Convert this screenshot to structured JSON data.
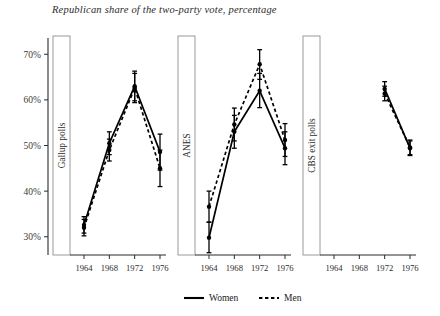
{
  "chart_data": {
    "type": "line",
    "title": "Republican share of the two-party vote, percentage",
    "xlabel": "",
    "ylabel": "",
    "ylim": [
      26,
      74
    ],
    "yticks": [
      30,
      40,
      50,
      60,
      70
    ],
    "ytick_labels": [
      "30%",
      "40%",
      "50%",
      "60%",
      "70%"
    ],
    "x": [
      1964,
      1968,
      1972,
      1976
    ],
    "xtick_labels": [
      "1964",
      "1968",
      "1972",
      "1976"
    ],
    "grid": false,
    "legend_position": "bottom",
    "legend": [
      {
        "label": "Women",
        "style": "solid"
      },
      {
        "label": "Men",
        "style": "dashed"
      }
    ],
    "panels": [
      {
        "label": "Gallup polls",
        "series": [
          {
            "name": "Women",
            "style": "solid",
            "values": [
              32.6,
              50.5,
              63.0,
              48.6
            ],
            "err_low": [
              30.8,
              48.0,
              59.8,
              44.6
            ],
            "err_high": [
              34.4,
              53.0,
              66.3,
              52.5
            ]
          },
          {
            "name": "Men",
            "style": "dashed",
            "values": [
              32.0,
              49.0,
              62.6,
              45.0
            ],
            "err_low": [
              30.2,
              46.6,
              59.4,
              41.0
            ],
            "err_high": [
              33.8,
              51.4,
              65.8,
              49.0
            ]
          }
        ]
      },
      {
        "label": "ANES",
        "series": [
          {
            "name": "Women",
            "style": "solid",
            "values": [
              29.8,
              53.0,
              62.0,
              49.4
            ],
            "err_low": [
              26.5,
              49.4,
              58.3,
              45.8
            ],
            "err_high": [
              33.2,
              56.6,
              65.8,
              53.0
            ]
          },
          {
            "name": "Men",
            "style": "dashed",
            "values": [
              36.6,
              54.6,
              67.8,
              51.2
            ],
            "err_low": [
              33.2,
              51.0,
              64.5,
              47.6
            ],
            "err_high": [
              40.0,
              58.2,
              71.0,
              54.8
            ]
          }
        ]
      },
      {
        "label": "CBS exit polls",
        "series": [
          {
            "name": "Women",
            "style": "solid",
            "values": [
              null,
              null,
              62.4,
              49.4
            ],
            "err_low": [
              null,
              null,
              60.8,
              47.8
            ],
            "err_high": [
              null,
              null,
              64.0,
              51.0
            ]
          },
          {
            "name": "Men",
            "style": "dashed",
            "values": [
              null,
              null,
              61.4,
              49.6
            ],
            "err_low": [
              null,
              null,
              59.8,
              48.0
            ],
            "err_high": [
              null,
              null,
              63.0,
              51.2
            ]
          }
        ]
      }
    ]
  }
}
